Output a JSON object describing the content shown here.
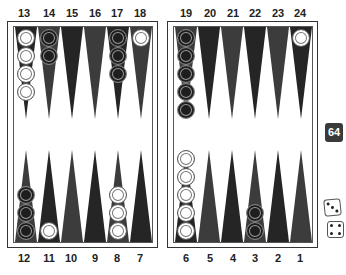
{
  "board": {
    "top_left_labels": [
      "13",
      "14",
      "15",
      "16",
      "17",
      "18"
    ],
    "top_right_labels": [
      "19",
      "20",
      "21",
      "22",
      "23",
      "24"
    ],
    "bottom_left_labels": [
      "12",
      "11",
      "10",
      "9",
      "8",
      "7"
    ],
    "bottom_right_labels": [
      "6",
      "5",
      "4",
      "3",
      "2",
      "1"
    ],
    "points": {
      "13": {
        "color": "white",
        "count": 4
      },
      "14": {
        "color": "black",
        "count": 2
      },
      "15": {
        "color": null,
        "count": 0
      },
      "16": {
        "color": null,
        "count": 0
      },
      "17": {
        "color": "black",
        "count": 3
      },
      "18": {
        "color": "white",
        "count": 1
      },
      "19": {
        "color": "black",
        "count": 5
      },
      "20": {
        "color": null,
        "count": 0
      },
      "21": {
        "color": null,
        "count": 0
      },
      "22": {
        "color": null,
        "count": 0
      },
      "23": {
        "color": null,
        "count": 0
      },
      "24": {
        "color": "white",
        "count": 1
      },
      "12": {
        "color": "black",
        "count": 3
      },
      "11": {
        "color": "white",
        "count": 1
      },
      "10": {
        "color": null,
        "count": 0
      },
      "9": {
        "color": null,
        "count": 0
      },
      "8": {
        "color": "white",
        "count": 3
      },
      "7": {
        "color": null,
        "count": 0
      },
      "6": {
        "color": "white",
        "count": 5
      },
      "5": {
        "color": null,
        "count": 0
      },
      "4": {
        "color": null,
        "count": 0
      },
      "3": {
        "color": "black",
        "count": 2
      },
      "2": {
        "color": null,
        "count": 0
      },
      "1": {
        "color": null,
        "count": 0
      }
    },
    "colors": {
      "point_dark": "#252525",
      "point_mid": "#3c3c3c",
      "frame": "#333333",
      "background": "#ffffff"
    }
  },
  "doubling_cube": {
    "value": "64"
  },
  "dice": [
    {
      "value": 3,
      "icon": "die-three-icon"
    },
    {
      "value": 4,
      "icon": "die-four-icon"
    }
  ]
}
